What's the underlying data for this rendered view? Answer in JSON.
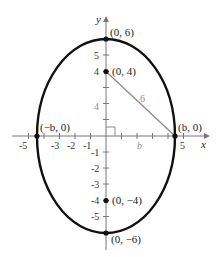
{
  "diagram": {
    "axes": {
      "x_label": "x",
      "y_label": "y",
      "x_ticks": [
        "-5",
        "-3",
        "-2",
        "-1",
        "5"
      ],
      "y_ticks": [
        "5",
        "4",
        "-1",
        "-2",
        "-3",
        "-4",
        "-5"
      ]
    },
    "points": {
      "top_vertex": "(0, 6)",
      "top_focus": "(0, 4)",
      "right_covertex": "(b, 0)",
      "left_covertex": "(−b, 0)",
      "bottom_focus": "(0, −4)",
      "bottom_vertex": "(0, −6)"
    },
    "segment_labels": {
      "hypotenuse": "6",
      "vertical_leg": "4",
      "horizontal_leg": "b"
    },
    "colors": {
      "ellipse": "#111111",
      "axes": "#777777",
      "triangle": "#8a8a8a"
    }
  }
}
